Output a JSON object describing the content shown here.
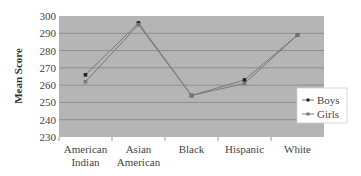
{
  "chart_data": {
    "type": "line",
    "title": "",
    "xlabel": "",
    "ylabel": "Mean Score",
    "ylim": [
      230,
      300
    ],
    "yticks": [
      230,
      240,
      250,
      260,
      270,
      280,
      290,
      300
    ],
    "grid": true,
    "legend_position": "right",
    "categories": [
      [
        "American",
        "Indian"
      ],
      [
        "Asian",
        "American"
      ],
      [
        "Black"
      ],
      [
        "Hispanic"
      ],
      [
        "White"
      ]
    ],
    "category_names": [
      "American Indian",
      "Asian American",
      "Black",
      "Hispanic",
      "White"
    ],
    "series": [
      {
        "name": "Boys",
        "values": [
          266,
          296,
          254,
          263,
          289
        ],
        "marker": "square",
        "color": "#222222"
      },
      {
        "name": "Girls",
        "values": [
          262,
          295,
          254,
          261,
          289
        ],
        "marker": "square",
        "color": "#777777"
      }
    ]
  },
  "colors": {
    "plot_bg": "#b5b5b5",
    "grid": "#8e8e8e",
    "line": "#7a7a7a"
  }
}
